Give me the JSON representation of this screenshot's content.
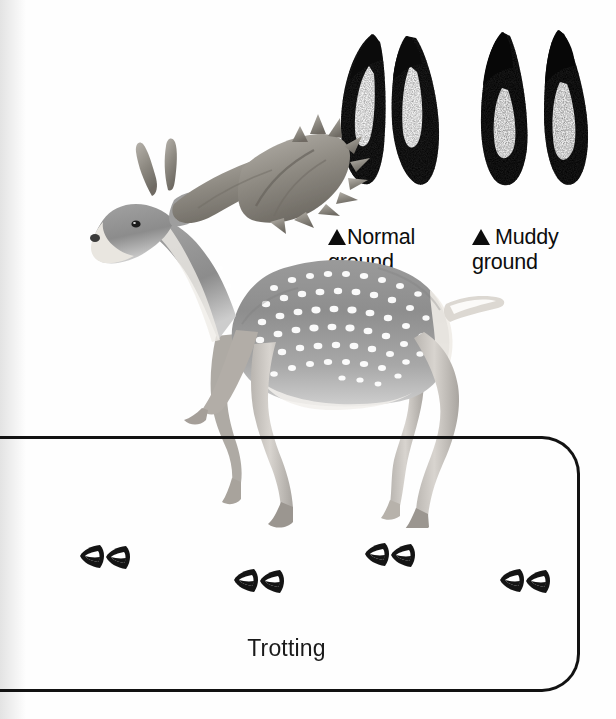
{
  "figure": {
    "background_color": "#ffffff",
    "ink_color": "#121212"
  },
  "specimens": [
    {
      "id": "normal-ground",
      "icon": "triangle-bullet",
      "label_line1": "Normal",
      "label_line2": "ground",
      "print_type": "cloven-hoof-pair",
      "description": "two rounded teardrop cleaves, stippled"
    },
    {
      "id": "muddy-ground",
      "icon": "triangle-bullet",
      "label_line1": "Muddy",
      "label_line2": "ground",
      "print_type": "cloven-hoof-pair-splayed",
      "description": "narrow elongated cleaves, splayed"
    }
  ],
  "illustration": {
    "animal": "fallow-deer",
    "pose": "trotting",
    "features": [
      "palmate-antlers",
      "white-spotted-coat",
      "white-rump-patch",
      "raised-tail"
    ]
  },
  "panel": {
    "caption": "Trotting",
    "border_radius_px": 38,
    "tracks": [
      {
        "index": 1,
        "x": 78,
        "y": 542
      },
      {
        "index": 2,
        "x": 232,
        "y": 566
      },
      {
        "index": 3,
        "x": 363,
        "y": 540
      },
      {
        "index": 4,
        "x": 498,
        "y": 566
      }
    ],
    "track_count": 4,
    "track_glyph": "cloven-hoof-pair"
  }
}
